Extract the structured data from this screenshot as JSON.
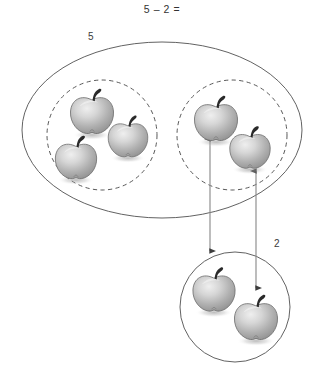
{
  "scene": {
    "title": "5 – 2 =",
    "background_color": "#ffffff",
    "stroke_color": "#555555",
    "text_color": "#333333",
    "apple_body_light": "#e8e8e8",
    "apple_body_mid": "#b4b4b4",
    "apple_body_dark": "#8a8a8a",
    "apple_stem_color": "#2a2a2a"
  },
  "labels": {
    "total": "5",
    "subtrahend": "2"
  },
  "groups": {
    "outer_set": {
      "name": "outer-set-ellipse",
      "label": "5",
      "shape": "ellipse",
      "line_style": "solid",
      "cx": 162,
      "cy": 130,
      "rx": 140,
      "ry": 88
    },
    "remaining_group": {
      "name": "remaining-subset",
      "shape": "circle",
      "line_style": "dashed",
      "cx": 102,
      "cy": 135,
      "r": 55,
      "apple_count": 3
    },
    "removed_group": {
      "name": "removed-subset",
      "shape": "circle",
      "line_style": "dashed",
      "cx": 232,
      "cy": 135,
      "r": 55,
      "apple_count": 2
    },
    "taken_away_group": {
      "name": "taken-away-set",
      "label": "2",
      "shape": "circle",
      "line_style": "solid",
      "cx": 235,
      "cy": 307,
      "r": 55,
      "apple_count": 2
    }
  },
  "apples": {
    "left_group": [
      {
        "id": "apple-left-1",
        "x": 92,
        "y": 112,
        "scale": 1.0
      },
      {
        "id": "apple-left-2",
        "x": 128,
        "y": 137,
        "scale": 0.92
      },
      {
        "id": "apple-left-3",
        "x": 76,
        "y": 158,
        "scale": 0.96
      }
    ],
    "right_group": [
      {
        "id": "apple-right-1",
        "x": 216,
        "y": 119,
        "scale": 1.0
      },
      {
        "id": "apple-right-2",
        "x": 250,
        "y": 148,
        "scale": 0.94
      }
    ],
    "bottom_group": [
      {
        "id": "apple-bottom-1",
        "x": 214,
        "y": 290,
        "scale": 0.98
      },
      {
        "id": "apple-bottom-2",
        "x": 256,
        "y": 318,
        "scale": 1.0
      }
    ]
  },
  "arrows": [
    {
      "id": "arrow-left",
      "x": 210,
      "y_top": 139,
      "y_bottom": 251,
      "double_headed": true
    },
    {
      "id": "arrow-right",
      "x": 256,
      "y_top": 171,
      "y_bottom": 288,
      "double_headed": true
    }
  ]
}
